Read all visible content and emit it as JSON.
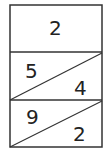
{
  "diagram": {
    "top_cell": {
      "value": "2"
    },
    "rows": [
      {
        "top_left": "5",
        "bottom_right": "4"
      },
      {
        "top_left": "9",
        "bottom_right": "2"
      }
    ],
    "colors": {
      "line": "#333333",
      "text": "#222222"
    }
  }
}
